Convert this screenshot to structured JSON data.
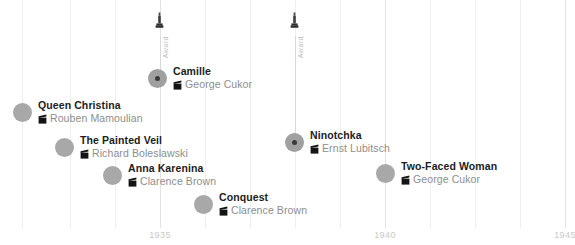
{
  "chart_data": {
    "type": "scatter",
    "title": "",
    "xlabel": "",
    "ylabel": "",
    "xlim": [
      1932.6,
      1945.4
    ],
    "grid": true,
    "legend": "none",
    "x_tick_labels": [
      "1935",
      "1940",
      "1945"
    ],
    "series": [
      {
        "name": "Greta Garbo films",
        "points": [
          {
            "label": "Queen Christina",
            "director": "Rouben Mamoulian",
            "year": 1933,
            "awarded": false
          },
          {
            "label": "The Painted Veil",
            "director": "Richard Boleslawski",
            "year": 1934,
            "awarded": false
          },
          {
            "label": "Anna Karenina",
            "director": "Clarence Brown",
            "year": 1935,
            "awarded": false
          },
          {
            "label": "Camille",
            "director": "George Cukor",
            "year": 1936,
            "awarded": true
          },
          {
            "label": "Conquest",
            "director": "Clarence Brown",
            "year": 1937,
            "awarded": false
          },
          {
            "label": "Ninotchka",
            "director": "Ernst Lubitsch",
            "year": 1939,
            "awarded": true
          },
          {
            "label": "Two-Faced Woman",
            "director": "George Cukor",
            "year": 1941,
            "awarded": false
          }
        ]
      }
    ],
    "annotations": [
      {
        "type": "award",
        "label": "Award",
        "year": 1936
      },
      {
        "type": "award",
        "label": "Award",
        "year": 1939
      }
    ]
  },
  "axis": {
    "ticks": [
      {
        "label": "1935",
        "x": 160
      },
      {
        "label": "1940",
        "x": 385
      },
      {
        "label": "1945",
        "x": 565
      }
    ],
    "gridlines_x": [
      22,
      70,
      115,
      160,
      205,
      250,
      295,
      340,
      385,
      430,
      475,
      520,
      565
    ]
  },
  "awards": [
    {
      "name": "Award",
      "x": 160,
      "icon": "oscar-statuette-icon",
      "stem_top": 36,
      "stem_bottom": 72
    },
    {
      "name": "Award",
      "x": 295,
      "icon": "oscar-statuette-icon",
      "stem_top": 36,
      "stem_bottom": 140
    }
  ],
  "events": [
    {
      "title": "Queen Christina",
      "director": "Rouben Mamoulian",
      "x": 13,
      "y": 100,
      "awarded": false
    },
    {
      "title": "Camille",
      "director": "George Cukor",
      "x": 148,
      "y": 66,
      "awarded": true
    },
    {
      "title": "The Painted Veil",
      "director": "Richard Boleslawski",
      "x": 55,
      "y": 135,
      "awarded": false
    },
    {
      "title": "Anna Karenina",
      "director": "Clarence Brown",
      "x": 103,
      "y": 163,
      "awarded": false
    },
    {
      "title": "Ninotchka",
      "director": "Ernst Lubitsch",
      "x": 285,
      "y": 130,
      "awarded": true
    },
    {
      "title": "Conquest",
      "director": "Clarence Brown",
      "x": 194,
      "y": 192,
      "awarded": false
    },
    {
      "title": "Two-Faced Woman",
      "director": "George Cukor",
      "x": 376,
      "y": 161,
      "awarded": false
    }
  ]
}
